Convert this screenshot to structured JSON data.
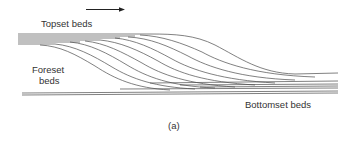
{
  "figure": {
    "caption": "(a)",
    "flow_direction_arrow": "arrow-right",
    "labels": {
      "topset": "Topset beds",
      "foreset_line1": "Foreset",
      "foreset_line2": "beds",
      "bottomset": "Bottomset beds"
    },
    "colors": {
      "line": "#4a4a4a",
      "text": "#333333",
      "background": "#ffffff"
    }
  }
}
